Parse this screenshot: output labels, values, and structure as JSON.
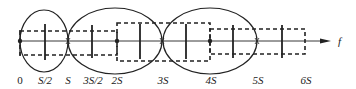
{
  "diagram": {
    "axis_label": "f",
    "tick_labels": [
      {
        "text": "0",
        "x": 20
      },
      {
        "text": "S/2",
        "x": 45
      },
      {
        "text": "S",
        "x": 68
      },
      {
        "text": "3S/2",
        "x": 93
      },
      {
        "text": "2S",
        "x": 117
      },
      {
        "text": "3S",
        "x": 163
      },
      {
        "text": "4S",
        "x": 211
      },
      {
        "text": "5S",
        "x": 258
      },
      {
        "text": "6S",
        "x": 306
      }
    ],
    "colors": {
      "stroke": "#222222",
      "background": "#ffffff"
    }
  }
}
